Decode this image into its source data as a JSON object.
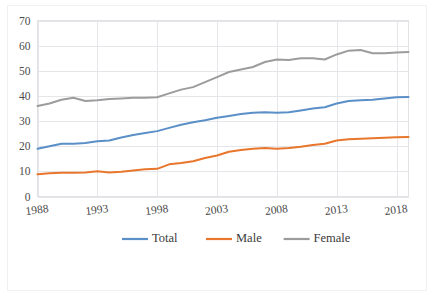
{
  "chart_data": {
    "type": "line",
    "title": "",
    "subtitle": "",
    "xlabel": "",
    "ylabel": "",
    "x": [
      1988,
      1989,
      1990,
      1991,
      1992,
      1993,
      1994,
      1995,
      1996,
      1997,
      1998,
      1999,
      2000,
      2001,
      2002,
      2003,
      2004,
      2005,
      2006,
      2007,
      2008,
      2009,
      2010,
      2011,
      2012,
      2013,
      2014,
      2015,
      2016,
      2017,
      2018,
      2019
    ],
    "xlim": [
      1988,
      2019
    ],
    "ylim": [
      0,
      70
    ],
    "yticks": [
      0,
      10,
      20,
      30,
      40,
      50,
      60,
      70
    ],
    "xticks": [
      1988,
      1993,
      1998,
      2003,
      2008,
      2013,
      2018
    ],
    "ytick_labels": [
      "0",
      "10",
      "20",
      "30",
      "40",
      "50",
      "60",
      "70"
    ],
    "xtick_labels": [
      "1988",
      "1993",
      "1998",
      "2003",
      "2008",
      "2013",
      "2018"
    ],
    "grid": "horizontal-and-vertical",
    "legend_position": "bottom",
    "series": [
      {
        "name": "Total",
        "color": "#5B8FC7",
        "values": [
          19.0,
          20.0,
          21.0,
          21.0,
          21.3,
          22.0,
          22.3,
          23.5,
          24.5,
          25.3,
          26.0,
          27.3,
          28.5,
          29.5,
          30.3,
          31.3,
          32.0,
          32.8,
          33.3,
          33.5,
          33.3,
          33.5,
          34.2,
          35.0,
          35.5,
          37.0,
          38.0,
          38.3,
          38.5,
          39.0,
          39.5,
          39.6
        ]
      },
      {
        "name": "Male",
        "color": "#E8762C",
        "values": [
          8.8,
          9.2,
          9.4,
          9.4,
          9.5,
          10.0,
          9.5,
          9.8,
          10.3,
          10.8,
          11.0,
          12.8,
          13.3,
          14.0,
          15.3,
          16.3,
          17.8,
          18.5,
          19.0,
          19.3,
          19.0,
          19.3,
          19.8,
          20.5,
          21.0,
          22.3,
          22.8,
          23.0,
          23.2,
          23.4,
          23.6,
          23.7
        ]
      },
      {
        "name": "Female",
        "color": "#9C9C9C",
        "values": [
          36.0,
          37.0,
          38.5,
          39.3,
          38.0,
          38.3,
          38.8,
          39.0,
          39.3,
          39.3,
          39.5,
          41.0,
          42.5,
          43.5,
          45.5,
          47.5,
          49.5,
          50.5,
          51.5,
          53.5,
          54.5,
          54.3,
          55.0,
          55.0,
          54.5,
          56.5,
          58.0,
          58.3,
          57.0,
          57.0,
          57.3,
          57.5
        ]
      }
    ]
  },
  "legend": {
    "items": [
      {
        "label": "Total",
        "color": "#5B8FC7"
      },
      {
        "label": "Male",
        "color": "#E8762C"
      },
      {
        "label": "Female",
        "color": "#9C9C9C"
      }
    ]
  },
  "colors": {
    "total": "#5B8FC7",
    "male": "#E8762C",
    "female": "#9C9C9C",
    "grid": "#e4e6e9",
    "axis_text": "#4b4b4b",
    "background": "#ffffff"
  }
}
